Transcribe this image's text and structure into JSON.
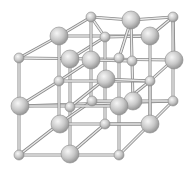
{
  "diagram": {
    "title": "",
    "type": "crystal-lattice",
    "colors": {
      "background": "#ffffff",
      "rod": "#e8e8e8",
      "rod_edge": "#8a8a8a",
      "sphere_light": "#f4f4f4",
      "sphere_mid": "#c6c6c6",
      "sphere_dark": "#8c8c8c"
    },
    "rods": [
      [
        19,
        58,
        59,
        36
      ],
      [
        59,
        36,
        91,
        17
      ],
      [
        91,
        17,
        131,
        20
      ],
      [
        131,
        20,
        173,
        17
      ],
      [
        59,
        36,
        150,
        36
      ],
      [
        150,
        36,
        173,
        17
      ],
      [
        19,
        58,
        174,
        60
      ],
      [
        70,
        59,
        105,
        37
      ],
      [
        105,
        37,
        150,
        36
      ],
      [
        105,
        37,
        91,
        17
      ],
      [
        119,
        58,
        131,
        20
      ],
      [
        174,
        60,
        173,
        17
      ],
      [
        19,
        58,
        19,
        155
      ],
      [
        59,
        36,
        59,
        81
      ],
      [
        150,
        36,
        150,
        124
      ],
      [
        173,
        17,
        173,
        101
      ],
      [
        70,
        59,
        70,
        154
      ],
      [
        91,
        17,
        91,
        101
      ],
      [
        131,
        20,
        133,
        101
      ],
      [
        105,
        37,
        105,
        124
      ],
      [
        119,
        58,
        119,
        155
      ],
      [
        19,
        106,
        173,
        101
      ],
      [
        59,
        81,
        150,
        81
      ],
      [
        19,
        106,
        59,
        81
      ],
      [
        59,
        81,
        91,
        60
      ],
      [
        91,
        60,
        131,
        61
      ],
      [
        70,
        107,
        105,
        79
      ],
      [
        105,
        79,
        150,
        81
      ],
      [
        119,
        106,
        150,
        81
      ],
      [
        150,
        81,
        173,
        60
      ],
      [
        19,
        155,
        59,
        124
      ],
      [
        59,
        124,
        92,
        101
      ],
      [
        92,
        101,
        133,
        101
      ],
      [
        133,
        101,
        173,
        101
      ],
      [
        70,
        154,
        105,
        124
      ],
      [
        105,
        124,
        150,
        124
      ],
      [
        119,
        155,
        150,
        124
      ],
      [
        150,
        124,
        173,
        101
      ],
      [
        19,
        155,
        119,
        155
      ],
      [
        19,
        106,
        119,
        106
      ],
      [
        59,
        124,
        150,
        124
      ],
      [
        70,
        107,
        70,
        107
      ],
      [
        59,
        81,
        59,
        124
      ],
      [
        150,
        81,
        150,
        124
      ]
    ],
    "spheres": [
      {
        "x": 91,
        "y": 17,
        "r": 5
      },
      {
        "x": 173,
        "y": 17,
        "r": 5
      },
      {
        "x": 131,
        "y": 20,
        "r": 9
      },
      {
        "x": 59,
        "y": 36,
        "r": 9
      },
      {
        "x": 150,
        "y": 36,
        "r": 9
      },
      {
        "x": 105,
        "y": 37,
        "r": 5
      },
      {
        "x": 19,
        "y": 58,
        "r": 5
      },
      {
        "x": 119,
        "y": 58,
        "r": 5
      },
      {
        "x": 132,
        "y": 61,
        "r": 5
      },
      {
        "x": 91,
        "y": 60,
        "r": 9
      },
      {
        "x": 70,
        "y": 59,
        "r": 9
      },
      {
        "x": 174,
        "y": 60,
        "r": 9
      },
      {
        "x": 59,
        "y": 81,
        "r": 5
      },
      {
        "x": 150,
        "y": 81,
        "r": 5
      },
      {
        "x": 106,
        "y": 79,
        "r": 9
      },
      {
        "x": 92,
        "y": 101,
        "r": 5
      },
      {
        "x": 133,
        "y": 101,
        "r": 9
      },
      {
        "x": 173,
        "y": 101,
        "r": 5
      },
      {
        "x": 20,
        "y": 106,
        "r": 9
      },
      {
        "x": 70,
        "y": 107,
        "r": 5
      },
      {
        "x": 119,
        "y": 106,
        "r": 9
      },
      {
        "x": 60,
        "y": 124,
        "r": 9
      },
      {
        "x": 105,
        "y": 124,
        "r": 5
      },
      {
        "x": 150,
        "y": 124,
        "r": 9
      },
      {
        "x": 19,
        "y": 155,
        "r": 5
      },
      {
        "x": 70,
        "y": 154,
        "r": 9
      },
      {
        "x": 119,
        "y": 155,
        "r": 5
      }
    ]
  }
}
